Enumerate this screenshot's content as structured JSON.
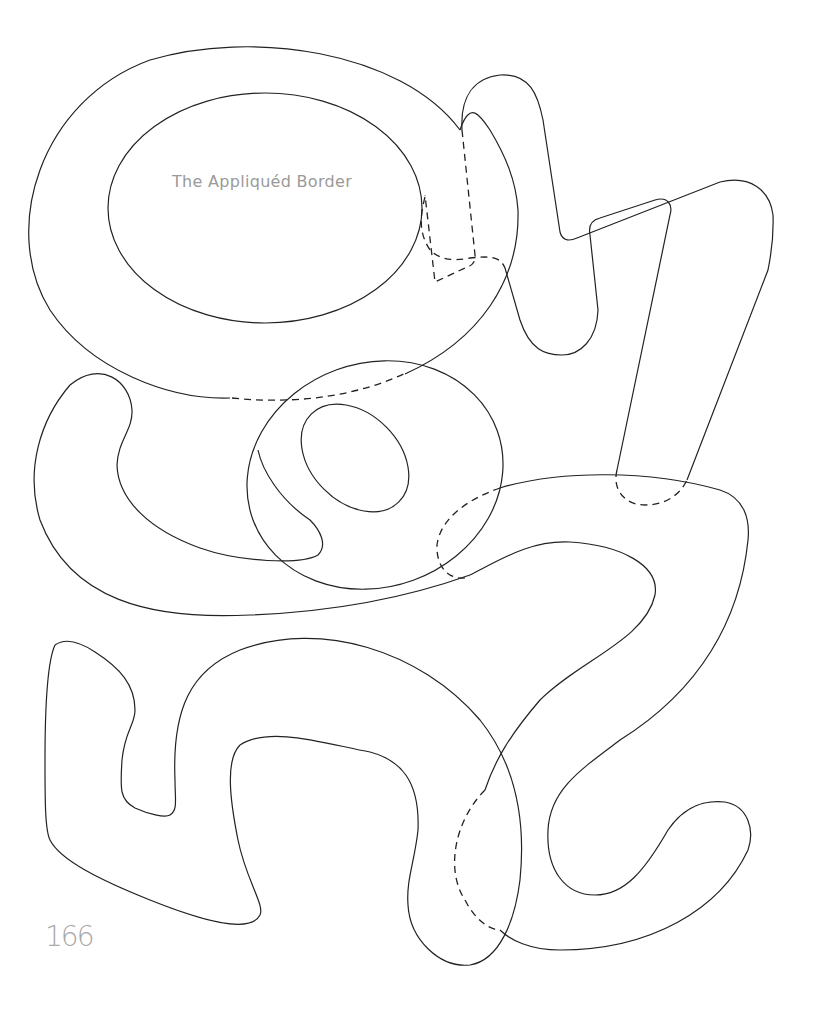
{
  "page": {
    "title": "The Appliquéd Border",
    "page_number": "166"
  },
  "pattern": {
    "description": "Appliqué template outlines of numerals and shapes",
    "line_color": "#222222",
    "text_color": "#9a9a9a",
    "line_types": [
      "solid-cut-line",
      "dashed-overlap-line"
    ]
  }
}
